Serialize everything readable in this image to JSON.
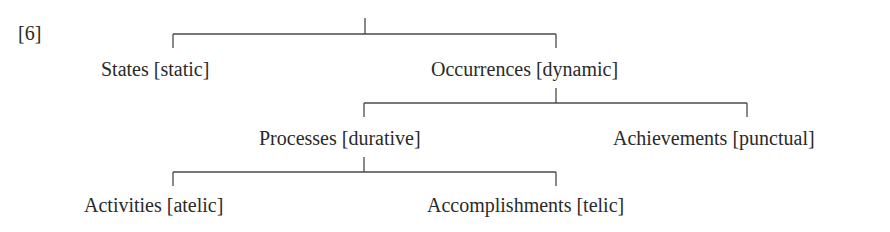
{
  "figure": {
    "number_label": "[6]"
  },
  "tree": {
    "root": {
      "children": [
        {
          "id": "states",
          "label": "States [static]"
        },
        {
          "id": "occurrences",
          "label": "Occurrences [dynamic]",
          "children": [
            {
              "id": "processes",
              "label": "Processes [durative]",
              "children": [
                {
                  "id": "activities",
                  "label": "Activities [atelic]"
                },
                {
                  "id": "accomplishments",
                  "label": "Accomplishments [telic]"
                }
              ]
            },
            {
              "id": "achievements",
              "label": "Achievements [punctual]"
            }
          ]
        }
      ]
    }
  },
  "nodes": {
    "states": "States [static]",
    "occurrences": "Occurrences [dynamic]",
    "processes": "Processes [durative]",
    "achievements": "Achievements [punctual]",
    "activities": "Activities [atelic]",
    "accomplishments": "Accomplishments [telic]"
  },
  "colors": {
    "text": "#2a2a2a",
    "lines": "#4a4a4a",
    "background": "#ffffff"
  }
}
